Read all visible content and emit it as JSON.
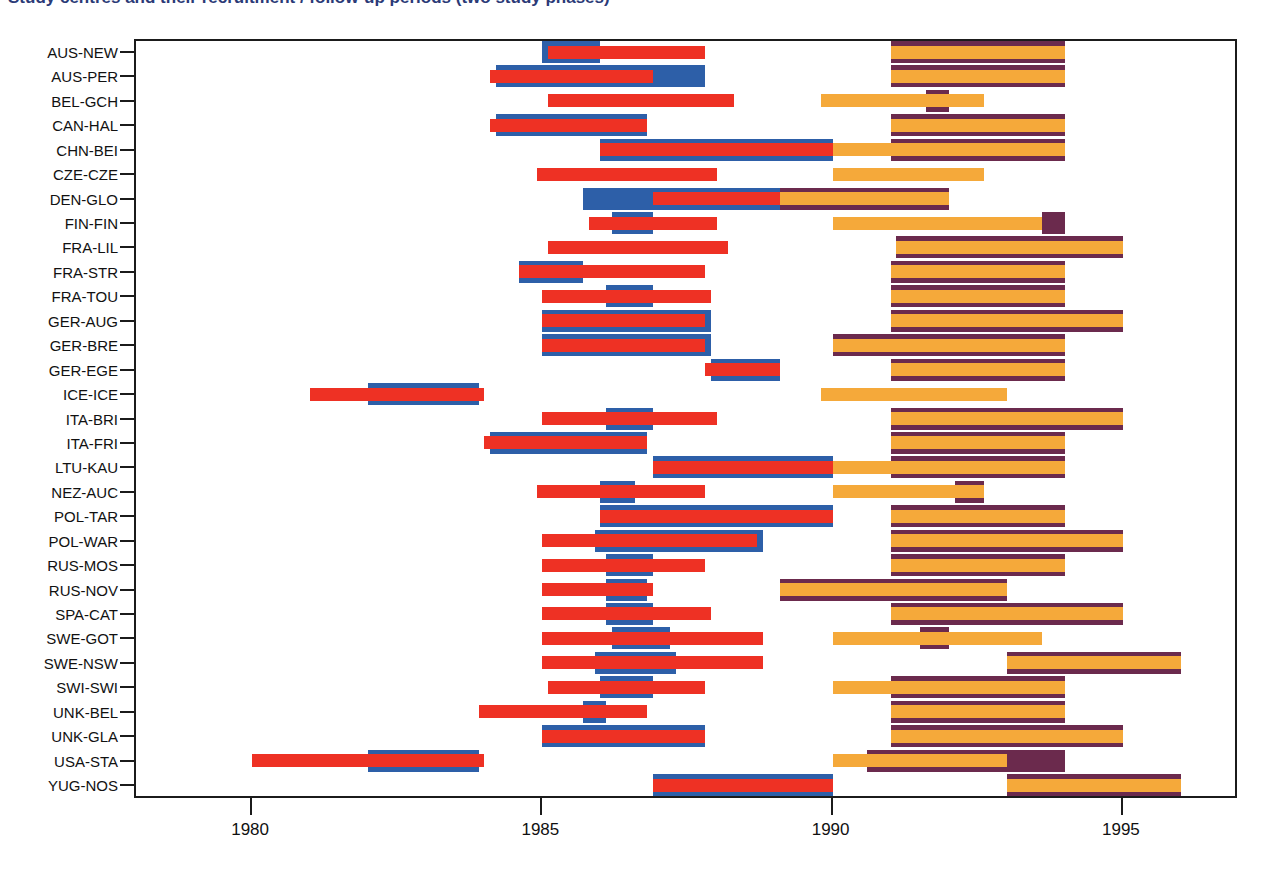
{
  "title": "Study centres and their recruitment / follow-up periods (two study phases)",
  "axes": {
    "x_ticks": [
      {
        "label": "1980",
        "value": 1980
      },
      {
        "label": "1985",
        "value": 1985
      },
      {
        "label": "1990",
        "value": 1990
      },
      {
        "label": "1995",
        "value": 1995
      }
    ],
    "x_min": 1978.0,
    "x_max": 1997.0,
    "xlabel": "",
    "ylabel": "",
    "grid": false
  },
  "colors": {
    "blue": "#2d5fa8",
    "red": "#ee3124",
    "purple": "#6b2a4d",
    "orange": "#f5a93a",
    "frame": "#1b1b1b",
    "title": "#2b3a77",
    "background": "#ffffff"
  },
  "legend": {
    "entries": [
      {
        "name": "phase1-outer",
        "color": "#2d5fa8",
        "label": "Phase 1 total period"
      },
      {
        "name": "phase1-inner",
        "color": "#ee3124",
        "label": "Phase 1 core period"
      },
      {
        "name": "phase2-outer",
        "color": "#6b2a4d",
        "label": "Phase 2 total period"
      },
      {
        "name": "phase2-inner",
        "color": "#f5a93a",
        "label": "Phase 2 core period"
      }
    ]
  },
  "chart_data": {
    "type": "bar",
    "orientation": "horizontal-ranges",
    "title": "Study centres and their recruitment / follow-up periods (two study phases)",
    "xlabel": "",
    "ylabel": "",
    "xlim": [
      1978.0,
      1997.0
    ],
    "categories": [
      "AUS-NEW",
      "AUS-PER",
      "BEL-GCH",
      "CAN-HAL",
      "CHN-BEI",
      "CZE-CZE",
      "DEN-GLO",
      "FIN-FIN",
      "FRA-LIL",
      "FRA-STR",
      "FRA-TOU",
      "GER-AUG",
      "GER-BRE",
      "GER-EGE",
      "ICE-ICE",
      "ITA-BRI",
      "ITA-FRI",
      "LTU-KAU",
      "NEZ-AUC",
      "POL-TAR",
      "POL-WAR",
      "RUS-MOS",
      "RUS-NOV",
      "SPA-CAT",
      "SWE-GOT",
      "SWE-NSW",
      "SWI-SWI",
      "UNK-BEL",
      "UNK-GLA",
      "USA-STA",
      "YUG-NOS"
    ],
    "series": [
      {
        "name": "phase1-outer",
        "color": "#2d5fa8",
        "ranges": [
          [
            1985.0,
            1986.0
          ],
          [
            1984.2,
            1987.8
          ],
          [
            null,
            null
          ],
          [
            1984.2,
            1986.8
          ],
          [
            1986.0,
            1990.0
          ],
          [
            null,
            null
          ],
          [
            1985.7,
            1989.2
          ],
          [
            1986.2,
            1986.9
          ],
          [
            null,
            null
          ],
          [
            1984.6,
            1985.7
          ],
          [
            1986.1,
            1986.9
          ],
          [
            1985.0,
            1987.9
          ],
          [
            1985.0,
            1987.9
          ],
          [
            1987.9,
            1989.1
          ],
          [
            1982.0,
            1983.9
          ],
          [
            1986.1,
            1986.9
          ],
          [
            1984.1,
            1986.8
          ],
          [
            1986.9,
            1990.0
          ],
          [
            1986.0,
            1986.6
          ],
          [
            1986.0,
            1990.0
          ],
          [
            1985.9,
            1988.8
          ],
          [
            1986.1,
            1986.9
          ],
          [
            1986.1,
            1986.8
          ],
          [
            1986.1,
            1986.9
          ],
          [
            1986.2,
            1987.2
          ],
          [
            1985.9,
            1987.3
          ],
          [
            1986.0,
            1986.9
          ],
          [
            1985.7,
            1986.1
          ],
          [
            1985.0,
            1987.8
          ],
          [
            1982.0,
            1983.9
          ],
          [
            1986.9,
            1990.0
          ]
        ]
      },
      {
        "name": "phase1-inner",
        "color": "#ee3124",
        "ranges": [
          [
            1985.1,
            1987.8
          ],
          [
            1984.1,
            1986.9
          ],
          [
            1985.1,
            1988.3
          ],
          [
            1984.1,
            1986.8
          ],
          [
            1986.0,
            1990.0
          ],
          [
            1984.9,
            1988.0
          ],
          [
            1986.9,
            1989.1
          ],
          [
            1985.8,
            1988.0
          ],
          [
            1985.1,
            1988.2
          ],
          [
            1984.6,
            1987.8
          ],
          [
            1985.0,
            1987.9
          ],
          [
            1985.0,
            1987.8
          ],
          [
            1985.0,
            1987.8
          ],
          [
            1987.8,
            1989.1
          ],
          [
            1981.0,
            1984.0
          ],
          [
            1985.0,
            1988.0
          ],
          [
            1984.0,
            1986.8
          ],
          [
            1986.9,
            1990.0
          ],
          [
            1984.9,
            1987.8
          ],
          [
            1986.0,
            1990.0
          ],
          [
            1985.0,
            1988.7
          ],
          [
            1985.0,
            1987.8
          ],
          [
            1985.0,
            1986.9
          ],
          [
            1985.0,
            1987.9
          ],
          [
            1985.0,
            1988.8
          ],
          [
            1985.0,
            1988.8
          ],
          [
            1985.1,
            1987.8
          ],
          [
            1983.9,
            1986.8
          ],
          [
            1985.0,
            1987.8
          ],
          [
            1980.0,
            1984.0
          ],
          [
            1986.9,
            1990.0
          ]
        ]
      },
      {
        "name": "phase2-outer",
        "color": "#6b2a4d",
        "ranges": [
          [
            1991.0,
            1994.0
          ],
          [
            1991.0,
            1994.0
          ],
          [
            1991.6,
            1992.0
          ],
          [
            1991.0,
            1994.0
          ],
          [
            1991.0,
            1994.0
          ],
          [
            null,
            null
          ],
          [
            1989.1,
            1992.0
          ],
          [
            1993.6,
            1994.0
          ],
          [
            1991.1,
            1995.0
          ],
          [
            1991.0,
            1994.0
          ],
          [
            1991.0,
            1994.0
          ],
          [
            1991.0,
            1995.0
          ],
          [
            1990.0,
            1994.0
          ],
          [
            1991.0,
            1994.0
          ],
          [
            null,
            null
          ],
          [
            1991.0,
            1995.0
          ],
          [
            1991.0,
            1994.0
          ],
          [
            1991.0,
            1994.0
          ],
          [
            1992.1,
            1992.6
          ],
          [
            1991.0,
            1994.0
          ],
          [
            1991.0,
            1995.0
          ],
          [
            1991.0,
            1994.0
          ],
          [
            1989.1,
            1993.0
          ],
          [
            1991.0,
            1995.0
          ],
          [
            1991.5,
            1992.0
          ],
          [
            1993.0,
            1996.0
          ],
          [
            1991.0,
            1994.0
          ],
          [
            1991.0,
            1994.0
          ],
          [
            1991.0,
            1995.0
          ],
          [
            1990.6,
            1994.0
          ],
          [
            1993.0,
            1996.0
          ]
        ]
      },
      {
        "name": "phase2-inner",
        "color": "#f5a93a",
        "ranges": [
          [
            1991.0,
            1994.0
          ],
          [
            1991.0,
            1994.0
          ],
          [
            1989.8,
            1992.6
          ],
          [
            1991.0,
            1994.0
          ],
          [
            1990.0,
            1994.0
          ],
          [
            1990.0,
            1992.6
          ],
          [
            1989.1,
            1992.0
          ],
          [
            1990.0,
            1993.6
          ],
          [
            1991.1,
            1995.0
          ],
          [
            1991.0,
            1994.0
          ],
          [
            1991.0,
            1994.0
          ],
          [
            1991.0,
            1995.0
          ],
          [
            1990.0,
            1994.0
          ],
          [
            1991.0,
            1994.0
          ],
          [
            1989.8,
            1993.0
          ],
          [
            1991.0,
            1995.0
          ],
          [
            1991.0,
            1994.0
          ],
          [
            1990.0,
            1994.0
          ],
          [
            1990.0,
            1992.6
          ],
          [
            1991.0,
            1994.0
          ],
          [
            1991.0,
            1995.0
          ],
          [
            1991.0,
            1994.0
          ],
          [
            1989.1,
            1993.0
          ],
          [
            1991.0,
            1995.0
          ],
          [
            1990.0,
            1993.6
          ],
          [
            1993.0,
            1996.0
          ],
          [
            1990.0,
            1994.0
          ],
          [
            1991.0,
            1994.0
          ],
          [
            1991.0,
            1995.0
          ],
          [
            1990.0,
            1993.0
          ],
          [
            1993.0,
            1996.0
          ]
        ]
      }
    ]
  }
}
